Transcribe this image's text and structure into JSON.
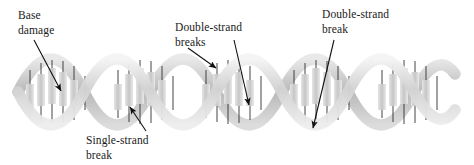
{
  "figure": {
    "background_color": "#ffffff",
    "helix": {
      "start_x": 18,
      "end_x": 455,
      "center_y": 92,
      "amplitude": 30,
      "period": 88,
      "turns": 5,
      "ribbon_color_front": "#d9d9d9",
      "ribbon_color_back": "#bfbfbf",
      "ribbon_highlight": "#f2f2f2",
      "rung_color": "#c4c4c4",
      "rung_line_color": "#2b2b2b",
      "base_block_color": "#cfcfcf"
    }
  },
  "labels": [
    {
      "id": "base-damage",
      "line1": "Base",
      "line2": "damage",
      "x": 18,
      "y": 8,
      "arrow_from": [
        34,
        40
      ],
      "arrow_to": [
        63,
        94
      ]
    },
    {
      "id": "double-strand-breaks",
      "line1": "Double-strand",
      "line2": "breaks",
      "x": 175,
      "y": 20,
      "arrow_from": [
        188,
        48
      ],
      "arrow_to": [
        218,
        70
      ]
    },
    {
      "id": "double-strand-break",
      "line1": "Double-strand",
      "line2": "break",
      "x": 322,
      "y": 7,
      "arrow_from": [
        334,
        40
      ],
      "arrow_to": [
        311,
        131
      ]
    },
    {
      "id": "single-strand-break",
      "line1": "Single-strand",
      "line2": "break",
      "x": 86,
      "y": 133,
      "arrow_from": [
        146,
        131
      ],
      "arrow_to": [
        128,
        104
      ]
    }
  ],
  "arrows": [
    {
      "id": "arrow-base-damage",
      "from": [
        34,
        40
      ],
      "to": [
        63,
        94
      ],
      "color": "#111111"
    },
    {
      "id": "arrow-dsb-left",
      "from": [
        188,
        48
      ],
      "to": [
        218,
        70
      ],
      "color": "#111111"
    },
    {
      "id": "arrow-dsb-middle",
      "from": [
        234,
        40
      ],
      "to": [
        251,
        108
      ],
      "color": "#111111"
    },
    {
      "id": "arrow-dsb-right",
      "from": [
        334,
        40
      ],
      "to": [
        311,
        131
      ],
      "color": "#111111"
    },
    {
      "id": "arrow-ssb",
      "from": [
        146,
        131
      ],
      "to": [
        128,
        104
      ],
      "color": "#111111"
    }
  ]
}
